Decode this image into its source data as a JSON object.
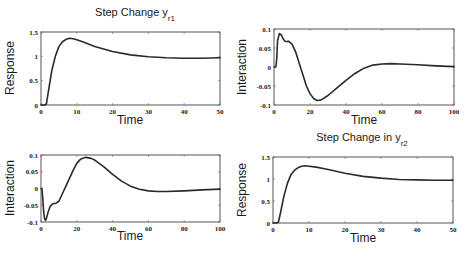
{
  "chart_data": [
    {
      "type": "line",
      "title": "Step Change y",
      "title_subscript": "r1",
      "xlabel": "Time",
      "ylabel": "Response",
      "xlim": [
        0,
        50
      ],
      "ylim": [
        0,
        1.5
      ],
      "xticks": [
        "0",
        "10",
        "20",
        "30",
        "40",
        "50"
      ],
      "yticks": [
        "0",
        "0.5",
        "1",
        "1.5"
      ],
      "grid": false,
      "series": [
        {
          "name": "y1 response",
          "x": [
            0,
            1,
            1.5,
            2,
            3,
            4,
            5,
            6,
            7,
            8,
            9,
            10,
            12,
            15,
            20,
            25,
            30,
            35,
            40,
            45,
            50
          ],
          "y": [
            0,
            0,
            0.02,
            0.25,
            0.7,
            1.0,
            1.2,
            1.3,
            1.35,
            1.37,
            1.36,
            1.34,
            1.29,
            1.2,
            1.1,
            1.03,
            0.99,
            0.97,
            0.96,
            0.96,
            0.97
          ]
        }
      ]
    },
    {
      "type": "line",
      "title": "",
      "xlabel": "Time",
      "ylabel": "Interaction",
      "xlim": [
        0,
        100
      ],
      "ylim": [
        -0.1,
        0.1
      ],
      "xticks": [
        "0",
        "20",
        "40",
        "60",
        "80",
        "100"
      ],
      "yticks": [
        "-0.1",
        "-0.05",
        "0",
        "0.05",
        "0.1"
      ],
      "grid": false,
      "series": [
        {
          "name": "y2 interaction (step in yr1)",
          "x": [
            0,
            1,
            1.5,
            2,
            3,
            4,
            5,
            6,
            7,
            8,
            10,
            12,
            14,
            16,
            18,
            20,
            22,
            24,
            26,
            30,
            35,
            40,
            45,
            50,
            55,
            60,
            65,
            70,
            80,
            90,
            100
          ],
          "y": [
            0,
            0,
            0.02,
            0.07,
            0.088,
            0.085,
            0.075,
            0.068,
            0.067,
            0.068,
            0.06,
            0.04,
            0.01,
            -0.02,
            -0.05,
            -0.07,
            -0.083,
            -0.088,
            -0.087,
            -0.075,
            -0.055,
            -0.035,
            -0.017,
            -0.003,
            0.005,
            0.008,
            0.009,
            0.008,
            0.006,
            0.003,
            0.001
          ]
        }
      ]
    },
    {
      "type": "line",
      "title": "",
      "xlabel": "Time",
      "ylabel": "Interaction",
      "xlim": [
        0,
        100
      ],
      "ylim": [
        -0.1,
        0.1
      ],
      "xticks": [
        "0",
        "20",
        "40",
        "60",
        "80",
        "100"
      ],
      "yticks": [
        "-0.1",
        "-0.05",
        "0",
        "0.05",
        "0.1"
      ],
      "grid": false,
      "series": [
        {
          "name": "y1 interaction (step in yr2)",
          "x": [
            0,
            0.5,
            1,
            1.5,
            2,
            2.5,
            3,
            4,
            5,
            6,
            7,
            8,
            10,
            12,
            15,
            18,
            20,
            22,
            25,
            28,
            30,
            35,
            40,
            45,
            50,
            55,
            60,
            65,
            70,
            80,
            90,
            100
          ],
          "y": [
            0,
            0,
            -0.03,
            -0.07,
            -0.09,
            -0.095,
            -0.09,
            -0.07,
            -0.055,
            -0.048,
            -0.045,
            -0.045,
            -0.038,
            -0.015,
            0.02,
            0.055,
            0.075,
            0.087,
            0.093,
            0.09,
            0.085,
            0.065,
            0.042,
            0.022,
            0.007,
            -0.002,
            -0.007,
            -0.009,
            -0.009,
            -0.007,
            -0.004,
            -0.002
          ]
        }
      ]
    },
    {
      "type": "line",
      "title": "Step Change in y",
      "title_subscript": "r2",
      "xlabel": "Time",
      "ylabel": "Response",
      "xlim": [
        0,
        50
      ],
      "ylim": [
        0,
        1.5
      ],
      "xticks": [
        "0",
        "10",
        "20",
        "30",
        "40",
        "50"
      ],
      "yticks": [
        "0",
        "0.5",
        "1",
        "1.5"
      ],
      "grid": false,
      "series": [
        {
          "name": "y2 response",
          "x": [
            0,
            1,
            1.5,
            2,
            3,
            4,
            5,
            6,
            7,
            8,
            9,
            10,
            12,
            15,
            20,
            25,
            30,
            35,
            40,
            45,
            50
          ],
          "y": [
            0,
            0,
            0.02,
            0.2,
            0.6,
            0.9,
            1.1,
            1.2,
            1.26,
            1.29,
            1.3,
            1.29,
            1.27,
            1.22,
            1.13,
            1.06,
            1.02,
            0.99,
            0.98,
            0.97,
            0.97
          ]
        }
      ]
    }
  ],
  "panels": [
    {
      "box": [
        41,
        32,
        220,
        105
      ],
      "title_pos": [
        135,
        16
      ],
      "xlabel_pos": [
        130,
        124
      ],
      "ylabel_pos": [
        14,
        68
      ]
    },
    {
      "box": [
        274,
        29,
        454,
        105
      ],
      "title_pos": [
        0,
        0
      ],
      "xlabel_pos": [
        364,
        124
      ],
      "ylabel_pos": [
        246,
        67
      ]
    },
    {
      "box": [
        41,
        155,
        220,
        222
      ],
      "title_pos": [
        0,
        0
      ],
      "xlabel_pos": [
        130,
        240
      ],
      "ylabel_pos": [
        14,
        188
      ]
    },
    {
      "box": [
        273,
        157,
        453,
        223
      ],
      "title_pos": [
        362,
        141
      ],
      "xlabel_pos": [
        363,
        242
      ],
      "ylabel_pos": [
        246,
        190
      ]
    }
  ]
}
